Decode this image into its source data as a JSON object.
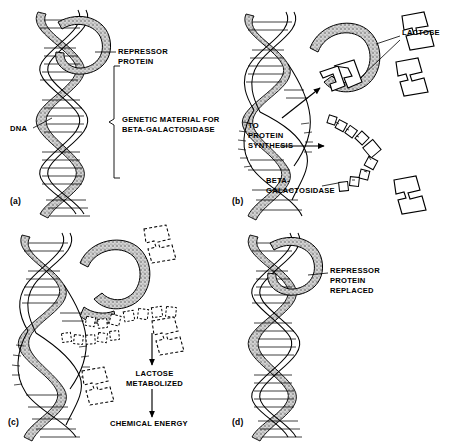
{
  "figure": {
    "panel_count": 4,
    "background_color": "#ffffff",
    "ink_color": "#000000",
    "protein_fill_color": "#b8b8b8"
  },
  "panels": [
    {
      "id": "a",
      "label": "(a)",
      "labels": [
        {
          "name": "repressor-protein",
          "text": "REPRESSOR\nPROTEIN"
        },
        {
          "name": "dna",
          "text": "DNA"
        },
        {
          "name": "genetic-material",
          "text": "GENETIC MATERIAL FOR\nBETA-GALACTOSIDASE"
        }
      ]
    },
    {
      "id": "b",
      "label": "(b)",
      "labels": [
        {
          "name": "lactose",
          "text": "LACTOSE"
        },
        {
          "name": "to-protein-synthesis",
          "text": "TO\nPROTEIN\nSYNTHESIS"
        },
        {
          "name": "beta-galactosidase",
          "text": "BETA-\nGALACTOSIDASE"
        }
      ]
    },
    {
      "id": "c",
      "label": "(c)",
      "labels": [
        {
          "name": "lactose-metabolized",
          "text": "LACTOSE\nMETABOLIZED"
        },
        {
          "name": "chemical-energy",
          "text": "CHEMICAL ENERGY"
        }
      ]
    },
    {
      "id": "d",
      "label": "(d)",
      "labels": [
        {
          "name": "repressor-protein-replaced",
          "text": "REPRESSOR\nPROTEIN\nREPLACED"
        }
      ]
    }
  ],
  "panel_a": {
    "tag": "(a)",
    "repressor_label": "REPRESSOR\nPROTEIN",
    "dna_label": "DNA",
    "genetic_label": "GENETIC MATERIAL FOR\nBETA-GALACTOSIDASE"
  },
  "panel_b": {
    "tag": "(b)",
    "lactose_label": "LACTOSE",
    "synthesis_label": "TO\nPROTEIN\nSYNTHESIS",
    "enzyme_label": "BETA-\nGALACTOSIDASE"
  },
  "panel_c": {
    "tag": "(c)",
    "metabolized_label": "LACTOSE\nMETABOLIZED",
    "energy_label": "CHEMICAL ENERGY"
  },
  "panel_d": {
    "tag": "(d)",
    "replaced_label": "REPRESSOR\nPROTEIN\nREPLACED"
  }
}
